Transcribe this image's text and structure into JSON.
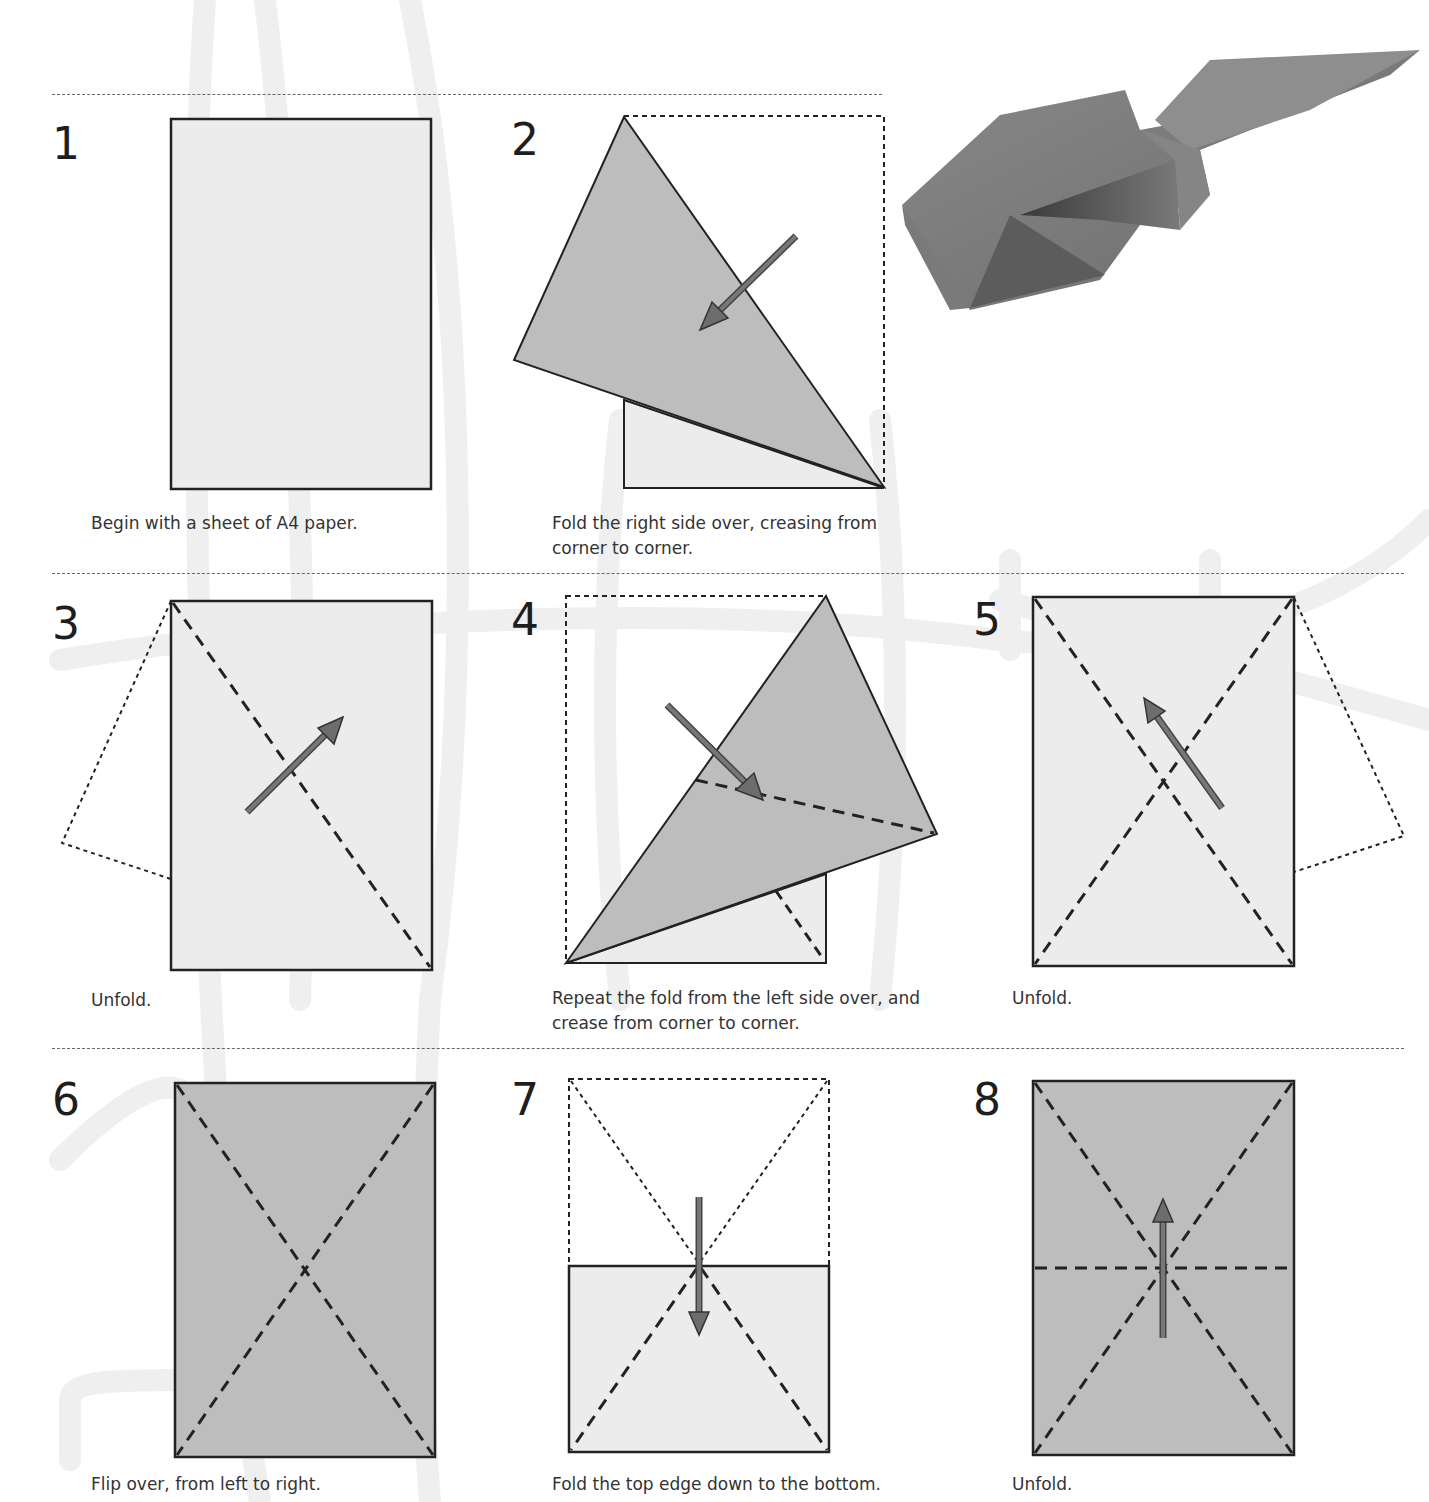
{
  "page": {
    "type": "origami-instructions",
    "colors": {
      "paper_front": "#ececec",
      "paper_back": "#bdbdbd",
      "outline": "#222222",
      "arrow": "#6d6d6d",
      "watermark": "#eeeeee"
    }
  },
  "photo": {
    "alt": "Finished folded paper plane model"
  },
  "steps": [
    {
      "number": "1",
      "caption": "Begin with a sheet of A4 paper."
    },
    {
      "number": "2",
      "caption_line1": "Fold the right side over, creasing from",
      "caption_line2": "corner to corner."
    },
    {
      "number": "3",
      "caption": "Unfold."
    },
    {
      "number": "4",
      "caption_line1": "Repeat the fold from the left side over, and",
      "caption_line2": "crease from corner to corner."
    },
    {
      "number": "5",
      "caption": "Unfold."
    },
    {
      "number": "6",
      "caption": "Flip over, from left to right."
    },
    {
      "number": "7",
      "caption": "Fold the top edge down to the bottom."
    },
    {
      "number": "8",
      "caption": "Unfold."
    }
  ]
}
